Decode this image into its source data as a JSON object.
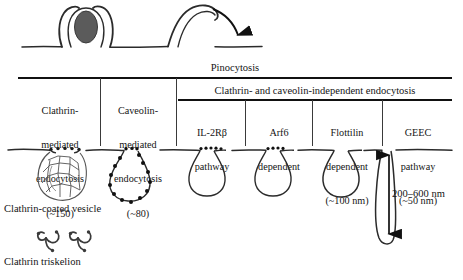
{
  "figure": {
    "title_row": {
      "pinocytosis": "Pinocytosis"
    },
    "top_illustration": {
      "particle_label": "engulfed-particle",
      "ruffle_label": "membrane-ruffle",
      "arrow_label": "internalization-arrow"
    },
    "table": {
      "group_header": "Clathrin- and caveolin-independent endocytosis",
      "columns": [
        {
          "id": "clathrin-mediated",
          "lines": [
            "Clathrin-",
            "mediated",
            "endocytosis",
            "(~150)"
          ]
        },
        {
          "id": "caveolin-mediated",
          "lines": [
            "Caveolin-",
            "mediated",
            "endocytosis",
            "(~80)"
          ]
        },
        {
          "id": "il2rb-pathway",
          "lines": [
            "IL-2Rβ",
            "pathway",
            "",
            ""
          ]
        },
        {
          "id": "arf6-dependent",
          "lines": [
            "Arf6",
            "dependent",
            "",
            ""
          ]
        },
        {
          "id": "flotillin-dependent",
          "lines": [
            "Flottilin",
            "dependent",
            "(~100 nm)",
            ""
          ]
        },
        {
          "id": "geec-pathway",
          "lines": [
            "GEEC",
            "pathway",
            "(~50 nm)",
            ""
          ]
        }
      ]
    },
    "membrane": {
      "structures": [
        "clathrin-coated-pit",
        "caveolin-coated-pit",
        "il2rb-pit",
        "arf6-pit",
        "flotillin-pit",
        "geec-tubule"
      ]
    },
    "dimension": {
      "value": "200–600 nm"
    },
    "legend": {
      "vesicle_caption": "Clathrin-coated vesicle",
      "triskelion_caption": "Clathrin triskelion"
    },
    "colors": {
      "ink": "#141414",
      "rule": "#111111",
      "particle_fill": "#5b5b5b",
      "background": "#ffffff"
    }
  }
}
